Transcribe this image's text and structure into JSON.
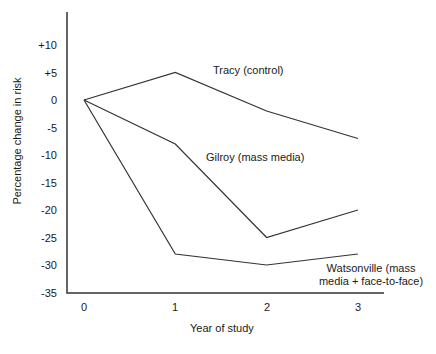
{
  "chart_data": {
    "type": "line",
    "title": "",
    "xlabel": "Year of study",
    "ylabel": "Percentage change in risk",
    "x": [
      0,
      1,
      2,
      3
    ],
    "x_tick_labels": [
      "0",
      "1",
      "2",
      "3"
    ],
    "y_tick_values": [
      10,
      5,
      0,
      -5,
      -10,
      -15,
      -20,
      -25,
      -30,
      -35
    ],
    "y_tick_labels": [
      "+10",
      "+5",
      "0",
      "-5",
      "-10",
      "-15",
      "-20",
      "-25",
      "-30",
      "-35"
    ],
    "ylim": [
      -35,
      12
    ],
    "xlim": [
      0,
      3
    ],
    "grid": false,
    "legend_position": "inline-labels",
    "line_color": "#333333",
    "axis_color": "#333333",
    "text_color": "#1a1a1a",
    "background_color": "#ffffff",
    "series": [
      {
        "name": "Tracy (control)",
        "values": [
          0,
          5,
          -2,
          -7
        ]
      },
      {
        "name": "Gilroy (mass media)",
        "values": [
          0,
          -8,
          -25,
          -20
        ]
      },
      {
        "name": "Watsonville (mass media + face-to-face)",
        "values": [
          0,
          -28,
          -30,
          -28
        ]
      }
    ]
  }
}
